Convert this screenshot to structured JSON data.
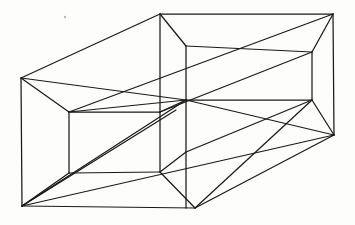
{
  "figure": {
    "type": "line-drawing",
    "canvas": {
      "width": 355,
      "height": 225
    },
    "background_color": "#fdfdfc",
    "line_color": "#1a1a1a",
    "line_width": 1.25
  },
  "geometry": {
    "vertices": {
      "outer_left_top": [
        21,
        78
      ],
      "outer_left_bottom": [
        22,
        206
      ],
      "outer_mid_top": [
        160,
        14
      ],
      "outer_mid_bottom": [
        195,
        208
      ],
      "outer_right_top": [
        333,
        14
      ],
      "outer_right_bottom": [
        334,
        135
      ],
      "inner_left_top": [
        69,
        112
      ],
      "inner_left_bottom": [
        69,
        173
      ],
      "inner_mid_upper": [
        186,
        46
      ],
      "inner_mid_lower": [
        186,
        100
      ],
      "inner_right_top": [
        312,
        52
      ],
      "inner_right_bottom": [
        312,
        100
      ],
      "inner_floor_mid": [
        160,
        172
      ],
      "inner_floor_right": [
        257,
        160
      ]
    },
    "paths": [
      {
        "name": "outer-left-vertical",
        "d": "M21,78 L22,206"
      },
      {
        "name": "outer-bottom-left-edge",
        "d": "M22,206 L195,208"
      },
      {
        "name": "outer-right-vertical",
        "d": "M333,14 L334,135"
      },
      {
        "name": "outer-top-ridge",
        "d": "M160,14 L333,14"
      },
      {
        "name": "outer-left-top-to-mid-top",
        "d": "M21,78 L160,14"
      },
      {
        "name": "outer-mid-top-vertical",
        "d": "M160,14 L160,172"
      },
      {
        "name": "outer-bottom-right-edge",
        "d": "M195,208 L334,135"
      },
      {
        "name": "inner-left-top-edge",
        "d": "M21,78 L69,112"
      },
      {
        "name": "inner-left-bottom-edge",
        "d": "M22,206 L69,173"
      },
      {
        "name": "inner-left-vertical",
        "d": "M69,112 L69,173"
      },
      {
        "name": "inner-left-top-horizontal",
        "d": "M69,112 L160,112"
      },
      {
        "name": "inner-left-bottom-horizontal",
        "d": "M69,173 L160,172"
      },
      {
        "name": "inner-mid-vertical",
        "d": "M186,46 L186,208"
      },
      {
        "name": "inner-top-connector",
        "d": "M160,14 L186,46"
      },
      {
        "name": "inner-mid-upper-to-right",
        "d": "M186,46 L312,52"
      },
      {
        "name": "inner-right-vertical",
        "d": "M312,52 L312,100"
      },
      {
        "name": "inner-mid-lower-to-right",
        "d": "M186,100 L312,100"
      },
      {
        "name": "inner-right-top-to-corner",
        "d": "M312,52 L333,14"
      },
      {
        "name": "inner-right-bottom-to-corner",
        "d": "M312,100 L334,135"
      },
      {
        "name": "inner-upper-left-to-mid",
        "d": "M160,112 L186,100"
      },
      {
        "name": "inner-floor-to-mid-bottom",
        "d": "M160,172 L195,208"
      },
      {
        "name": "diag-bottomleft-to-midupper",
        "d": "M22,206 L186,100"
      },
      {
        "name": "diag-bottomleft-to-innerlower",
        "d": "M22,206 L176,110"
      },
      {
        "name": "long-diag-lower",
        "d": "M22,206 L334,135"
      },
      {
        "name": "long-diag-upper",
        "d": "M69,112 L333,14"
      },
      {
        "name": "long-diag-upper-second",
        "d": "M160,112 L312,52"
      },
      {
        "name": "left-face-diag",
        "d": "M21,78 L186,100"
      },
      {
        "name": "right-lower-diag",
        "d": "M186,100 L334,135"
      },
      {
        "name": "floor-right-diag",
        "d": "M195,208 L312,100"
      },
      {
        "name": "mid-kink",
        "d": "M160,172 L186,152"
      },
      {
        "name": "back-horizontal-upper",
        "d": "M69,112 L186,100"
      },
      {
        "name": "back-horizontal-right",
        "d": "M186,152 L312,100"
      }
    ]
  },
  "marks": {
    "speck": {
      "x": 65,
      "y": 17,
      "r": 1.2
    }
  }
}
